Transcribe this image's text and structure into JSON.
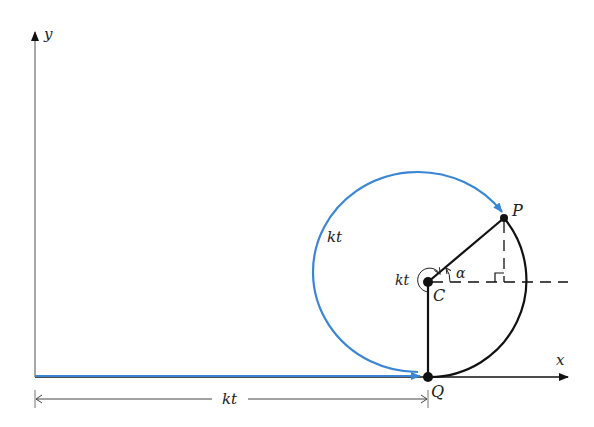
{
  "diagram": {
    "type": "cycloid-rolling-circle",
    "axes": {
      "x_label": "x",
      "y_label": "y"
    },
    "points": {
      "P": "P",
      "C": "C",
      "Q": "Q"
    },
    "labels": {
      "arc_length": "kt",
      "angle_total": "kt",
      "angle_alpha": "α",
      "horizontal_distance": "kt"
    },
    "colors": {
      "blue_arc": "#3a86d4",
      "black_lines": "#111111",
      "axis": "#555555"
    }
  }
}
